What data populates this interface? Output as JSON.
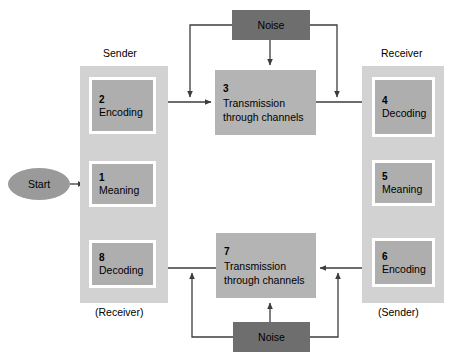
{
  "diagram": {
    "colors": {
      "panel": "#d2d2d2",
      "box": "#aeaeae",
      "transmission_box": "#b4b4b4",
      "noise_box": "#6e6e6e",
      "start_ellipse": "#9a9a9a",
      "line": "#3d3d3d",
      "background": "#ffffff"
    },
    "labels": {
      "sender_top": "Sender",
      "receiver_top": "Receiver",
      "receiver_bottom": "(Receiver)",
      "sender_bottom": "(Sender)"
    },
    "start": {
      "label": "Start"
    },
    "noise": [
      {
        "id": "noise-top",
        "label": "Noise"
      },
      {
        "id": "noise-bottom",
        "label": "Noise"
      }
    ],
    "steps": [
      {
        "id": "step-1",
        "num": "1",
        "caption": "Meaning",
        "column": "sender-left"
      },
      {
        "id": "step-2",
        "num": "2",
        "caption": "Encoding",
        "column": "sender-left"
      },
      {
        "id": "step-3",
        "num": "3",
        "caption": "Transmission\nthrough channels",
        "column": "center-top"
      },
      {
        "id": "step-4",
        "num": "4",
        "caption": "Decoding",
        "column": "receiver-right"
      },
      {
        "id": "step-5",
        "num": "5",
        "caption": "Meaning",
        "column": "receiver-right"
      },
      {
        "id": "step-6",
        "num": "6",
        "caption": "Encoding",
        "column": "receiver-right"
      },
      {
        "id": "step-7",
        "num": "7",
        "caption": "Transmission\nthrough channels",
        "column": "center-bottom"
      },
      {
        "id": "step-8",
        "num": "8",
        "caption": "Decoding",
        "column": "sender-left"
      }
    ]
  }
}
